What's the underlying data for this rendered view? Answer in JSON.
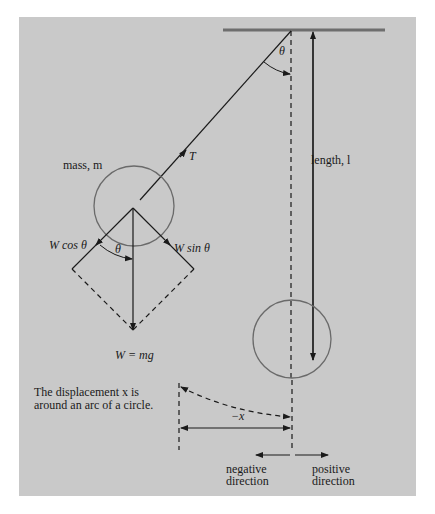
{
  "diagram": {
    "type": "simple pendulum force diagram",
    "colors": {
      "background_panel": "#c9c9c9",
      "ceiling": "#6e6e6e",
      "line": "#1a1a1a",
      "circle": "#6a6a6a"
    },
    "labels": {
      "theta_top": "θ",
      "tension": "T",
      "mass": "mass, m",
      "length": "length, l",
      "w_cos": "W cos θ",
      "w_sin": "W sin θ",
      "theta_bottom": "θ",
      "weight": "W = mg",
      "displacement_note_line1": "The displacement x is",
      "displacement_note_line2": "around an arc of a circle.",
      "neg_x": "−x",
      "negative_line1": "negative",
      "negative_line2": "direction",
      "positive_line1": "positive",
      "positive_line2": "direction"
    }
  }
}
